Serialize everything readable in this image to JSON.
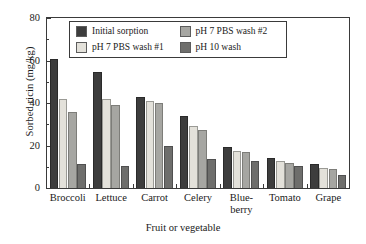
{
  "chart_data": {
    "type": "bar",
    "title": "",
    "xlabel": "Fruit or vegetable",
    "ylabel": "Sorbed ricin (mg/kg)",
    "categories": [
      "Broccoli",
      "Lettuce",
      "Carrot",
      "Celery",
      "Blue-\nberry",
      "Tomato",
      "Grape"
    ],
    "series": [
      {
        "name": "Initial sorption",
        "color": "#3d3d3d",
        "values": [
          60.5,
          54.5,
          43.0,
          34.0,
          19.5,
          14.0,
          11.5
        ]
      },
      {
        "name": "pH 7 PBS wash #1",
        "color": "#e3e1da",
        "values": [
          42.0,
          42.0,
          41.0,
          29.0,
          17.5,
          12.5,
          9.5
        ]
      },
      {
        "name": "pH 7 PBS wash #2",
        "color": "#a6a6a2",
        "values": [
          36.0,
          39.0,
          40.0,
          27.5,
          17.0,
          12.0,
          9.0
        ]
      },
      {
        "name": "pH 10 wash",
        "color": "#6e6e6c",
        "values": [
          11.5,
          10.5,
          20.0,
          13.5,
          12.5,
          10.5,
          6.0
        ]
      }
    ],
    "ylim": [
      0,
      80
    ],
    "yticks": [
      0,
      20,
      40,
      60,
      80
    ],
    "yticks_minor": [
      10,
      30,
      50,
      70
    ],
    "grid": false,
    "legend_position": "upper center",
    "legend_order": [
      [
        "Initial sorption",
        "pH 7 PBS wash #2"
      ],
      [
        "pH 7 PBS wash #1",
        "pH 10 wash"
      ]
    ]
  }
}
